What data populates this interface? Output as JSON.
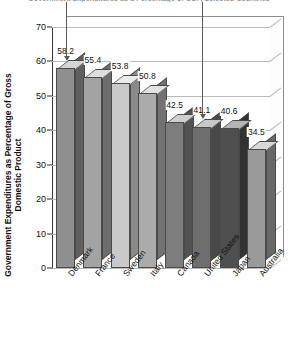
{
  "chart_data": {
    "type": "bar",
    "title": "Government Expenditures as a Percentage of GDP, Selected Countries",
    "xlabel": "",
    "ylabel": "Government Expenditures as Percentage of Gross Domestic Product",
    "ylim": [
      0,
      70
    ],
    "ytick_step": 10,
    "yticks": [
      "70",
      "60",
      "50",
      "40",
      "30",
      "20",
      "10",
      "0"
    ],
    "grid": true,
    "legend": "none",
    "style": "3d-bar-grayscale",
    "categories": [
      "Denmark",
      "France",
      "Sweden",
      "Italy",
      "Canada",
      "United States",
      "Japan",
      "Australia"
    ],
    "values": [
      58.2,
      55.4,
      53.8,
      50.8,
      42.5,
      41.1,
      40.6,
      34.5
    ],
    "value_labels": [
      "58.2",
      "55.4",
      "53.8",
      "50.8",
      "42.5",
      "41.1",
      "40.6",
      "34.5"
    ],
    "bar_colors": [
      "#8f8f8f",
      "#a3a3a3",
      "#c9c9c9",
      "#ababab",
      "#7d7d7d",
      "#6e6e6e",
      "#4f4f4f",
      "#9a9a9a"
    ],
    "bar_side_colors": [
      "#5f5f5f",
      "#6d6d6d",
      "#8a8a8a",
      "#727272",
      "#525252",
      "#484848",
      "#323232",
      "#686868"
    ],
    "bar_top_colors": [
      "#d5d5d5",
      "#dedede",
      "#ececec",
      "#e2e2e2",
      "#cfcfcf",
      "#c8c8c8",
      "#b4b4b4",
      "#d8d8d8"
    ],
    "annotations": [
      {
        "name": "arrow-denmark",
        "target": "Denmark",
        "direction": "down"
      },
      {
        "name": "arrow-united-states",
        "target": "United States",
        "direction": "down"
      }
    ]
  },
  "colors": {
    "axis": "#2b2b2b",
    "grid": "#b9b9b9",
    "text": "#111111",
    "annotation": "#5a5a5a",
    "background": "#ffffff"
  }
}
